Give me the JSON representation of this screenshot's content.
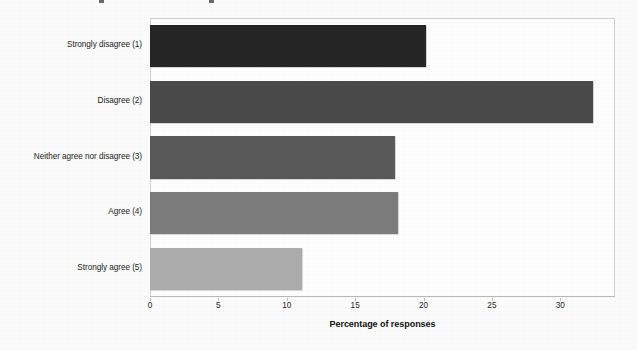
{
  "chart_data": {
    "type": "bar",
    "orientation": "horizontal",
    "title": "",
    "subtitle": "",
    "xlabel": "Percentage of responses",
    "ylabel": "",
    "categories": [
      "Strongly disagree (1)",
      "Disagree (2)",
      "Neither agree nor disagree (3)",
      "Agree (4)",
      "Strongly agree (5)"
    ],
    "values": [
      20.2,
      32.4,
      17.9,
      18.1,
      11.1
    ],
    "bar_colors": [
      "#262626",
      "#4a4a4a",
      "#5a5a5a",
      "#7d7d7d",
      "#adadad"
    ],
    "xlim": [
      0,
      34
    ],
    "xticks": [
      0,
      5,
      10,
      15,
      20,
      25,
      30
    ],
    "xticklabels": [
      "0",
      "5",
      "10",
      "15",
      "20",
      "25",
      "30"
    ],
    "grid": false,
    "legend": false,
    "legend_position": "none",
    "frame": true,
    "frame_color": "#d2d2d2",
    "background": "#ffffff"
  },
  "axis": {
    "x_title": "Percentage of responses",
    "axis_line_color": "#b9b9b9",
    "tick_label_color": "#1c1c1c"
  },
  "labels": {
    "category_text_color": "#1c1c1c"
  }
}
